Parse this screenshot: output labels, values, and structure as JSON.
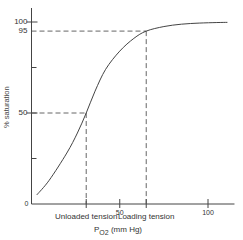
{
  "chart_data": {
    "type": "line",
    "title": "",
    "xlabel": "P O2 (mm Hg)",
    "xlabel_main": "P",
    "xlabel_sub": "O2",
    "xlabel_unit": "(mm Hg)",
    "ylabel": "% saturation",
    "xlim": [
      0,
      115
    ],
    "ylim": [
      0,
      100
    ],
    "x_ticks": [
      {
        "value": 31,
        "label": "Unloaded tension"
      },
      {
        "value": 50,
        "label": "50"
      },
      {
        "value": 65,
        "label": "Loading tension"
      },
      {
        "value": 100,
        "label": "100"
      }
    ],
    "y_ticks": [
      {
        "value": 0,
        "label": "0"
      },
      {
        "value": 25,
        "label": ""
      },
      {
        "value": 50,
        "label": "50"
      },
      {
        "value": 75,
        "label": ""
      },
      {
        "value": 95,
        "label": "95"
      },
      {
        "value": 100,
        "label": "100"
      }
    ],
    "series": [
      {
        "name": "Oxygen dissociation curve",
        "x": [
          3,
          10,
          20,
          26,
          31,
          36,
          42,
          50,
          58,
          65,
          75,
          85,
          95,
          105,
          111
        ],
        "y": [
          5,
          13,
          28,
          39,
          50,
          62,
          74,
          84,
          91,
          95,
          97.5,
          98.8,
          99.4,
          99.7,
          99.8
        ]
      }
    ],
    "annotations": [
      {
        "type": "dashed-guide",
        "x": 31,
        "y": 50,
        "label": "Unloaded tension"
      },
      {
        "type": "dashed-guide",
        "x": 65,
        "y": 95,
        "label": "Loading tension"
      }
    ],
    "grid": false,
    "legend": "none"
  }
}
